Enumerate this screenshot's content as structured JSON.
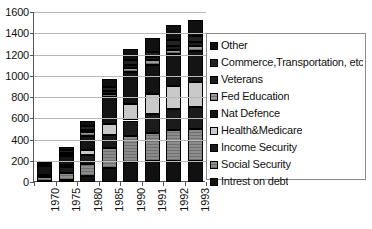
{
  "chart_data": {
    "type": "bar",
    "stacked": true,
    "title": "",
    "xlabel": "",
    "ylabel": "",
    "ylim": [
      0,
      1600
    ],
    "ytick_step": 200,
    "yticks": [
      "0",
      "200",
      "400",
      "600",
      "800",
      "1000",
      "1200",
      "1400",
      "1600"
    ],
    "grid": true,
    "legend_position": "right",
    "categories": [
      "1970",
      "1975",
      "1980",
      "1985",
      "1990",
      "1991",
      "1992",
      "1993"
    ],
    "series": [
      {
        "name": "Intrest on debt",
        "key": "interest",
        "swatch": "#111111",
        "values": [
          14,
          23,
          53,
          129,
          184,
          195,
          199,
          199
        ]
      },
      {
        "name": "Social Security",
        "key": "social",
        "swatch": "#8c8c8c",
        "values": [
          30,
          64,
          118,
          188,
          248,
          269,
          287,
          302
        ]
      },
      {
        "name": "Income Security",
        "key": "income",
        "swatch": "#1b1b1b",
        "values": [
          15,
          50,
          87,
          129,
          147,
          172,
          198,
          207
        ]
      },
      {
        "name": "Health&Medicare",
        "key": "health",
        "swatch": "#c9c9c9",
        "values": [
          6,
          20,
          44,
          98,
          155,
          194,
          219,
          235
        ]
      },
      {
        "name": "Nat Defence",
        "key": "defence",
        "swatch": "#141414",
        "values": [
          82,
          86,
          134,
          253,
          299,
          273,
          298,
          291
        ]
      },
      {
        "name": "Fed Education",
        "key": "fedu",
        "swatch": "#9a9a9a",
        "values": [
          8,
          16,
          32,
          29,
          38,
          42,
          45,
          49
        ]
      },
      {
        "name": "Veterans",
        "key": "vets",
        "swatch": "#1d1d1d",
        "values": [
          9,
          17,
          21,
          27,
          29,
          31,
          34,
          36
        ]
      },
      {
        "name": "Commerce,Transportation, etc",
        "key": "commerce",
        "swatch": "#232323",
        "values": [
          12,
          22,
          38,
          38,
          47,
          49,
          52,
          55
        ]
      },
      {
        "name": "Other",
        "key": "other",
        "swatch": "#101010",
        "values": [
          20,
          34,
          50,
          76,
          106,
          128,
          143,
          150
        ]
      }
    ],
    "totals": [
      196,
      332,
      577,
      967,
      1253,
      1353,
      1475,
      1524
    ]
  },
  "legend": {
    "items": [
      {
        "label": "Other"
      },
      {
        "label": "Commerce,Transportation, etc"
      },
      {
        "label": "Veterans"
      },
      {
        "label": "Fed Education"
      },
      {
        "label": "Nat Defence"
      },
      {
        "label": "Health&Medicare"
      },
      {
        "label": "Income Security"
      },
      {
        "label": "Social Security"
      },
      {
        "label": "Intrest on debt"
      }
    ]
  }
}
